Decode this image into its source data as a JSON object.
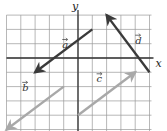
{
  "diagram": {
    "title": "",
    "axes": {
      "x_label": "x",
      "y_label": "y"
    },
    "grid": {
      "x_min": -5,
      "x_max": 5,
      "y_min": -5,
      "y_max": 3,
      "spacing_px": 14.3,
      "origin_px": [
        78,
        58
      ],
      "line_color": "#9a9a9a",
      "axis_color": "#333333"
    },
    "vectors": [
      {
        "name": "a",
        "label": "a",
        "tail": [
          1,
          2
        ],
        "head": [
          -3,
          -1
        ],
        "color": "#3a3a3a",
        "label_pos": [
          -1.1,
          0.7
        ]
      },
      {
        "name": "b",
        "label": "b",
        "tail": [
          -1,
          -2
        ],
        "head": [
          -5,
          -5
        ],
        "color": "#a8a8a8",
        "label_pos": [
          -3.9,
          -2.3
        ]
      },
      {
        "name": "c",
        "label": "c",
        "tail": [
          0,
          -4
        ],
        "head": [
          4,
          -1
        ],
        "color": "#a8a8a8",
        "label_pos": [
          1.3,
          -1.7
        ]
      },
      {
        "name": "d",
        "label": "d",
        "tail": [
          5,
          -1
        ],
        "head": [
          2,
          3
        ],
        "color": "#3a3a3a",
        "label_pos": [
          4.0,
          1.0
        ]
      }
    ]
  }
}
